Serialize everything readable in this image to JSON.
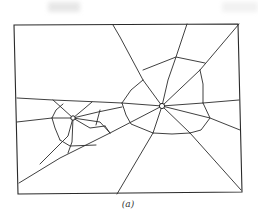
{
  "figure": {
    "caption": "(a)",
    "line_color": "#2a2a2a",
    "background": "#ffffff"
  },
  "frame": {
    "points": "14,25 238,24 242,192 18,194"
  },
  "impacts": [
    {
      "name": "large-impact",
      "cx": 162,
      "cy": 106,
      "r": 2.6
    },
    {
      "name": "small-impact",
      "cx": 73,
      "cy": 118,
      "r": 2.2
    }
  ],
  "cracks": [
    "113,25 120,37 143,80 162,106",
    "187,24 176,57 168,80 162,106",
    "239,24 200,70 162,106",
    "162,106 203,103 239,100",
    "162,106 210,118 240,130",
    "162,106 190,133 241,190",
    "162,106 153,133 117,194",
    "162,106 110,133 60,158 19,183",
    "162,106 122,103 100,102 53,100 17,98",
    "143,70 176,57 205,63",
    "200,70 203,84 203,103",
    "203,103 210,118 201,130 190,133",
    "153,133 172,134 190,133",
    "143,80 131,90 122,103",
    "122,103 126,115 131,124 153,133",
    "53,100 62,108 73,118",
    "92,102 85,108 73,118",
    "73,118 98,112 122,107",
    "73,118 100,122 110,133",
    "73,118 90,128 105,126",
    "73,118 68,136 57,147 40,164",
    "73,118 72,142 68,153",
    "73,118 52,118 17,122",
    "52,118 56,110 63,104",
    "52,118 55,128 60,140",
    "60,140 70,146 96,145",
    "96,125 100,110",
    "105,126 110,133"
  ]
}
